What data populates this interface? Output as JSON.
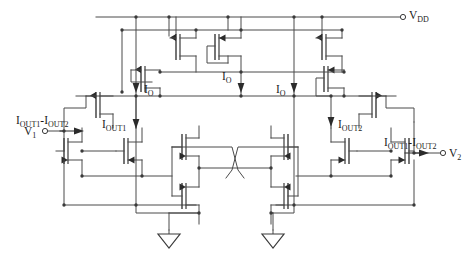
{
  "figure": {
    "kind": "circuit-schematic",
    "background_color": "#ffffff",
    "wire_color": "#4a4a4a",
    "device_color": "#3a3a3a",
    "text_color": "#1a1a1a"
  },
  "labels": {
    "vdd": "V",
    "vdd_sub": "DD",
    "v1": "V",
    "v1_sub": "1",
    "v2": "V",
    "v2_sub": "2",
    "i_o": "I",
    "i_o_sub": "O",
    "i_out1": "I",
    "i_out1_sub": "OUT1",
    "i_out2": "I",
    "i_out2_sub": "OUT2",
    "idiff_lead": "I",
    "idiff_sub1": "OUT1",
    "idiff_minus": "-I",
    "idiff_sub2": "OUT2"
  },
  "terminals": [
    {
      "name": "vdd-terminal",
      "label": "V_DD",
      "x": 404,
      "y": 15
    },
    {
      "name": "v1-input-terminal",
      "label": "V_1",
      "x": 43,
      "y": 130
    },
    {
      "name": "v2-output-terminal",
      "label": "V_2",
      "x": 451,
      "y": 152
    }
  ],
  "current_arrows": [
    {
      "name": "io-arrow-left",
      "label": "I_O",
      "x": 144,
      "y": 86
    },
    {
      "name": "io-arrow-center",
      "label": "I_O",
      "x": 234,
      "y": 86
    },
    {
      "name": "io-arrow-right",
      "label": "I_O",
      "x": 302,
      "y": 86
    },
    {
      "name": "iout1-arrow",
      "label": "I_OUT1",
      "x": 139,
      "y": 124
    },
    {
      "name": "iout2-arrow",
      "label": "I_OUT2",
      "x": 331,
      "y": 124
    },
    {
      "name": "idiff-arrow-left",
      "label": "I_OUT1-I_OUT2",
      "x": 78,
      "y": 130
    },
    {
      "name": "idiff-arrow-right",
      "label": "I_OUT1-I_OUT2",
      "x": 420,
      "y": 152
    }
  ],
  "grounds": [
    {
      "name": "ground-left",
      "x": 169,
      "y": 237
    },
    {
      "name": "ground-right",
      "x": 273,
      "y": 237
    }
  ],
  "transistors": [
    {
      "name": "pmos-bias-left",
      "type": "pmos",
      "x": 166,
      "y": 47
    },
    {
      "name": "pmos-bias-center",
      "type": "pmos",
      "x": 228,
      "y": 47,
      "diode_connected": true
    },
    {
      "name": "pmos-bias-right",
      "type": "pmos",
      "x": 312,
      "y": 47
    },
    {
      "name": "pmos-cascode-left",
      "type": "pmos",
      "x": 148,
      "y": 77
    },
    {
      "name": "pmos-cascode-right",
      "type": "pmos",
      "x": 331,
      "y": 77,
      "diode_connected": true
    },
    {
      "name": "pmos-source-left",
      "type": "pmos",
      "x": 103,
      "y": 102
    },
    {
      "name": "pmos-source-right",
      "type": "pmos",
      "x": 376,
      "y": 102
    },
    {
      "name": "nmos-input-left-a",
      "type": "nmos",
      "x": 70,
      "y": 152
    },
    {
      "name": "nmos-input-left-b",
      "type": "nmos",
      "x": 131,
      "y": 152
    },
    {
      "name": "nmos-input-right-a",
      "type": "nmos",
      "x": 348,
      "y": 152
    },
    {
      "name": "nmos-input-right-b",
      "type": "nmos",
      "x": 409,
      "y": 152
    },
    {
      "name": "nmos-cross-left-top",
      "type": "nmos",
      "x": 182,
      "y": 147
    },
    {
      "name": "nmos-cross-left-bottom",
      "type": "nmos",
      "x": 182,
      "y": 196
    },
    {
      "name": "nmos-cross-right-top",
      "type": "nmos",
      "x": 288,
      "y": 147
    },
    {
      "name": "nmos-cross-right-bottom",
      "type": "nmos",
      "x": 288,
      "y": 196
    }
  ]
}
